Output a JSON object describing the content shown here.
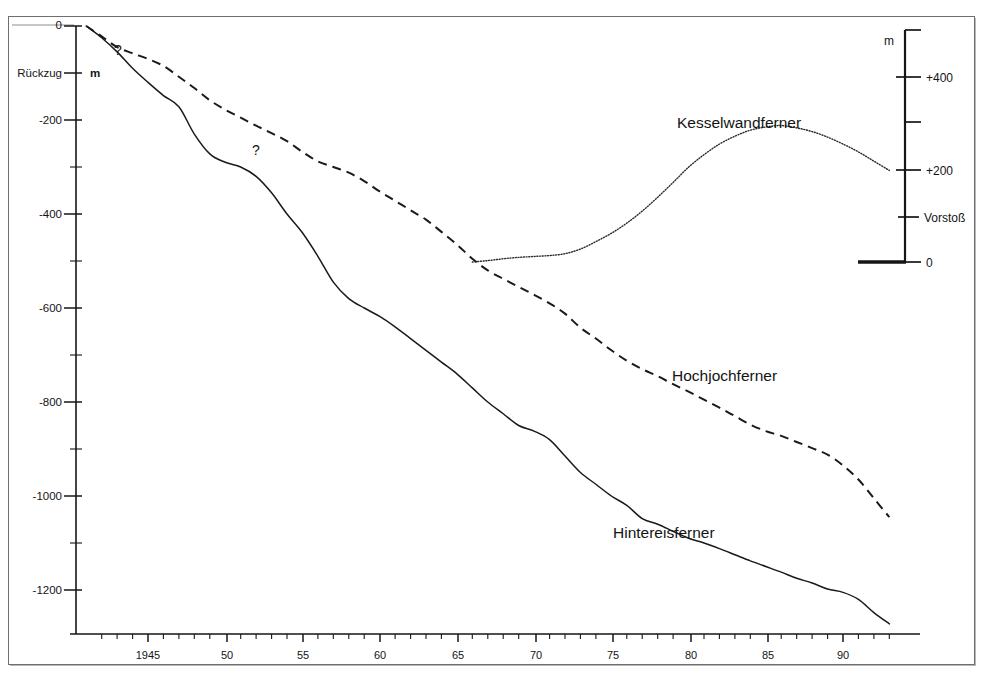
{
  "figure": {
    "y_axis_unit": "m",
    "retreat_label": "Rückzug",
    "y_ticks": [
      "0",
      "-200",
      "-400",
      "-600",
      "-800",
      "-1000",
      "-1200"
    ],
    "x_ticks": [
      "1945",
      "50",
      "55",
      "60",
      "65",
      "70",
      "75",
      "80",
      "85",
      "90"
    ],
    "uncertainty_marks": [
      "?",
      "?"
    ],
    "scale_bar": {
      "unit": "m",
      "labels": [
        "+400",
        "+200",
        "Vorstoß",
        "0"
      ],
      "advance_label": "Vorstoß",
      "zero_label": "0"
    },
    "curve_labels": {
      "kesselwandferner": "Kesselwandferner",
      "hochjochferner": "Hochjochferner",
      "hintereisferner": "Hintereisferner"
    },
    "colors": {
      "ink": "#1a1a1a",
      "frame": "#6e6e6e",
      "paper": "#ffffff"
    }
  },
  "chart_data": {
    "type": "line",
    "title": "",
    "subtitle": "",
    "xlabel": "",
    "ylabel": "m",
    "xlim": [
      1941,
      1993
    ],
    "ylim": [
      -1300,
      0
    ],
    "grid": false,
    "legend": "inline-labels",
    "y_tick_values": [
      0,
      -200,
      -400,
      -600,
      -800,
      -1000,
      -1200
    ],
    "x_tick_values": [
      1945,
      1950,
      1955,
      1960,
      1965,
      1970,
      1975,
      1980,
      1985,
      1990
    ],
    "minor_tick_interval_years": 1,
    "y_minor_tick_interval_m": 100,
    "annotations": [
      {
        "text": "Rückzug",
        "kind": "axis-direction",
        "axis": "y",
        "value_m": -145
      },
      {
        "text": "?",
        "kind": "uncertain-data",
        "x_year": 1943.8,
        "y_m": -60
      },
      {
        "text": "?",
        "kind": "uncertain-data",
        "x_year": 1952.2,
        "y_m": -250
      }
    ],
    "secondary_scale": {
      "unit": "m",
      "direction": "Vorstoß",
      "tick_values": [
        0,
        100,
        200,
        300,
        400,
        500
      ],
      "tick_labels": [
        "0",
        "Vorstoß",
        "+200",
        "",
        "+400",
        ""
      ],
      "note": "advance scale for Kesselwandferner"
    },
    "series": [
      {
        "name": "Hintereisferner",
        "style": "solid",
        "unit": "m cumulative retreat",
        "x": [
          1941,
          1942,
          1943,
          1944,
          1945,
          1946,
          1947,
          1948,
          1949,
          1950,
          1951,
          1952,
          1953,
          1954,
          1955,
          1956,
          1957,
          1958,
          1959,
          1960,
          1961,
          1962,
          1963,
          1964,
          1965,
          1966,
          1967,
          1968,
          1969,
          1970,
          1971,
          1972,
          1973,
          1974,
          1975,
          1976,
          1977,
          1978,
          1979,
          1980,
          1981,
          1982,
          1983,
          1984,
          1985,
          1986,
          1987,
          1988,
          1989,
          1990,
          1991,
          1992,
          1993
        ],
        "values": [
          0,
          -25,
          -55,
          -90,
          -120,
          -148,
          -172,
          -230,
          -272,
          -290,
          -300,
          -320,
          -355,
          -400,
          -440,
          -490,
          -545,
          -580,
          -600,
          -618,
          -640,
          -665,
          -690,
          -715,
          -740,
          -770,
          -800,
          -825,
          -850,
          -862,
          -880,
          -915,
          -950,
          -975,
          -1000,
          -1020,
          -1048,
          -1060,
          -1075,
          -1090,
          -1100,
          -1112,
          -1125,
          -1138,
          -1150,
          -1162,
          -1175,
          -1185,
          -1198,
          -1205,
          -1220,
          -1248,
          -1272
        ]
      },
      {
        "name": "Hochjochferner",
        "style": "dashed",
        "unit": "m cumulative retreat",
        "x": [
          1941,
          1942,
          1943,
          1944,
          1945,
          1946,
          1947,
          1948,
          1949,
          1950,
          1951,
          1952,
          1953,
          1954,
          1955,
          1956,
          1957,
          1958,
          1959,
          1960,
          1961,
          1962,
          1963,
          1964,
          1965,
          1966,
          1967,
          1968,
          1969,
          1970,
          1971,
          1972,
          1973,
          1974,
          1975,
          1976,
          1977,
          1978,
          1979,
          1980,
          1981,
          1982,
          1983,
          1984,
          1985,
          1986,
          1987,
          1988,
          1989,
          1990,
          1991,
          1992,
          1993
        ],
        "values": [
          0,
          -22,
          -45,
          -58,
          -70,
          -85,
          -108,
          -132,
          -158,
          -178,
          -195,
          -212,
          -228,
          -245,
          -268,
          -288,
          -300,
          -312,
          -330,
          -352,
          -372,
          -392,
          -412,
          -438,
          -465,
          -495,
          -520,
          -538,
          -555,
          -572,
          -590,
          -612,
          -642,
          -665,
          -690,
          -712,
          -730,
          -745,
          -762,
          -778,
          -795,
          -812,
          -830,
          -848,
          -862,
          -872,
          -885,
          -898,
          -912,
          -935,
          -965,
          -1005,
          -1045
        ]
      },
      {
        "name": "Kesselwandferner",
        "style": "dotted",
        "unit": "m cumulative advance (secondary scale)",
        "x": [
          1966,
          1967,
          1968,
          1969,
          1970,
          1971,
          1972,
          1973,
          1974,
          1975,
          1976,
          1977,
          1978,
          1979,
          1980,
          1981,
          1982,
          1983,
          1984,
          1985,
          1986,
          1987,
          1988,
          1989,
          1990,
          1991,
          1992,
          1993
        ],
        "values": [
          0,
          3,
          7,
          10,
          12,
          14,
          18,
          28,
          44,
          62,
          84,
          110,
          140,
          172,
          205,
          232,
          255,
          272,
          285,
          292,
          295,
          290,
          282,
          270,
          255,
          238,
          218,
          198
        ]
      }
    ]
  }
}
